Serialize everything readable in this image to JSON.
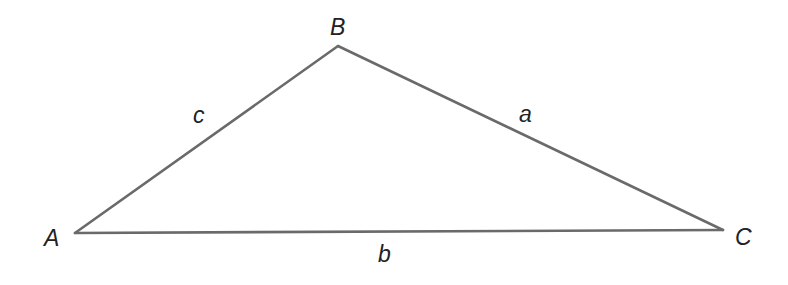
{
  "diagram": {
    "type": "triangle",
    "stroke_color": "#6a6a6a",
    "label_color": "#222222",
    "vertices": {
      "A": {
        "label": "A",
        "x": 75,
        "y": 233
      },
      "B": {
        "label": "B",
        "x": 338,
        "y": 46
      },
      "C": {
        "label": "C",
        "x": 723,
        "y": 230
      }
    },
    "sides": {
      "a": {
        "label": "a",
        "from": "B",
        "to": "C"
      },
      "b": {
        "label": "b",
        "from": "A",
        "to": "C"
      },
      "c": {
        "label": "c",
        "from": "A",
        "to": "B"
      }
    }
  }
}
